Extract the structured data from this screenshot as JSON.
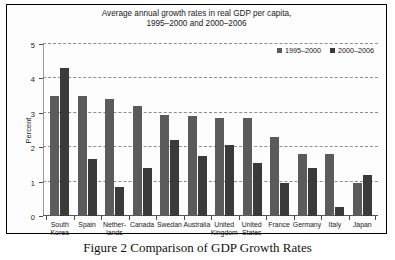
{
  "figure": {
    "caption": "Figure 2 Comparison of GDP Growth Rates"
  },
  "chart_data": {
    "type": "bar",
    "title": "Average annual growth rates in real GDP per capita,\n1995–2000 and 2000–2006",
    "xlabel": "",
    "ylabel": "Percent",
    "ylim": [
      0,
      5
    ],
    "yticks": [
      "0",
      "1",
      "2",
      "3",
      "4",
      "5"
    ],
    "grid": true,
    "legend_position": "top-right",
    "categories": [
      "South\nKorea",
      "Spain",
      "Nether-\nlands",
      "Canada",
      "Swedan",
      "Australia",
      "United\nKingdom",
      "United\nStates",
      "France",
      "Germany",
      "Italy",
      "Japan"
    ],
    "series": [
      {
        "name": "1995–2000",
        "color": "#5b5b5b",
        "values": [
          3.5,
          3.5,
          3.4,
          3.2,
          2.95,
          2.9,
          2.85,
          2.85,
          2.3,
          1.8,
          1.8,
          0.95
        ]
      },
      {
        "name": "2000–2006",
        "color": "#3a3a3a",
        "values": [
          4.3,
          1.65,
          0.85,
          1.4,
          2.2,
          1.75,
          2.05,
          1.55,
          0.95,
          1.4,
          0.25,
          1.2
        ]
      }
    ]
  }
}
